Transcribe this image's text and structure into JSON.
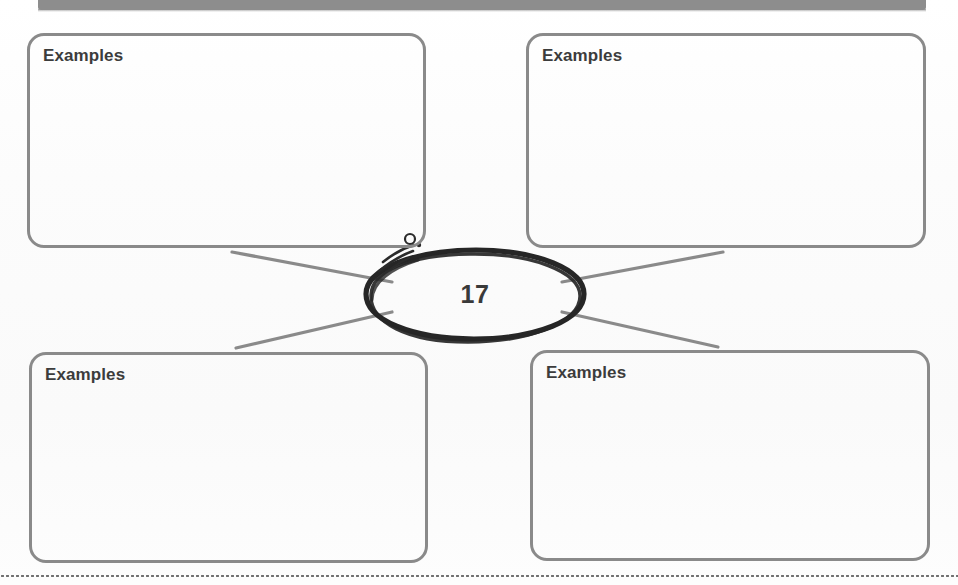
{
  "page": {
    "width": 958,
    "height": 585,
    "background_color": "#fdfdfd",
    "paper_type": "scanned-worksheet"
  },
  "header_band": {
    "name": "header-band",
    "color": "#8d8d8d",
    "note": "truncated gray bar at top edge of scanned page"
  },
  "organizer": {
    "type": "four-box-concept-web",
    "center": {
      "label": "17",
      "shape": "hand-drawn-oval",
      "stroke_color": "#262626",
      "text_color": "#3a3a3a"
    },
    "connector_color": "#8a8a8a",
    "box_border_color": "#8a8a8a",
    "label_color": "#3c3c3c",
    "boxes": [
      {
        "id": "top-left",
        "label": "Examples",
        "content": ""
      },
      {
        "id": "top-right",
        "label": "Examples",
        "content": ""
      },
      {
        "id": "bottom-left",
        "label": "Examples",
        "content": ""
      },
      {
        "id": "bottom-right",
        "label": "Examples",
        "content": ""
      }
    ]
  },
  "annotations": {
    "pen_circle": "small hand-drawn circle near top-left of the oval",
    "pen_strokes": "three short diagonal pen strokes beside the oval"
  },
  "footer": {
    "rule_style": "dotted",
    "rule_color": "#6f6f6f"
  }
}
